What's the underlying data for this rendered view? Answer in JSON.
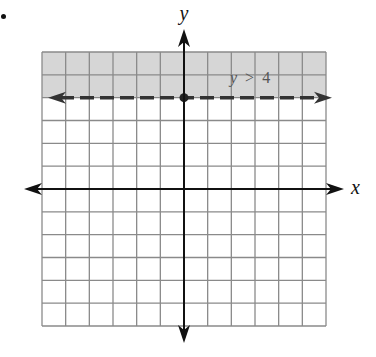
{
  "problem": {
    "bullet": "•"
  },
  "chart_data": {
    "type": "inequality-graph",
    "title": "",
    "inequality": "y > 4",
    "inequality_label": {
      "var": "y",
      "op": ">",
      "value": "4"
    },
    "boundary": {
      "type": "horizontal-line",
      "y": 4,
      "style": "dashed",
      "arrows": "both"
    },
    "shaded_region": "above boundary (y > 4)",
    "marked_point": {
      "x": 0,
      "y": 4
    },
    "xlabel": "x",
    "ylabel": "y",
    "xlim": [
      -6,
      6
    ],
    "ylim": [
      -6,
      6
    ],
    "grid": true,
    "grid_step": 1,
    "tick_labels": false
  },
  "colors": {
    "shade": "#d6d6d6",
    "grid": "#8a8a8a",
    "axis": "#111111",
    "boundary": "#333333",
    "label": "#555555"
  }
}
